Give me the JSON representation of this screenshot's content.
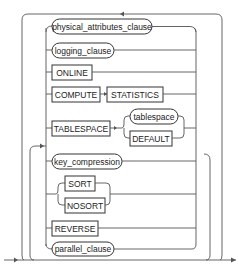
{
  "diagram": {
    "type": "railroad-syntax-diagram",
    "items": {
      "physical_attributes_clause": "physical_attributes_clause",
      "logging_clause": "logging_clause",
      "online": "ONLINE",
      "compute": "COMPUTE",
      "statistics": "STATISTICS",
      "tablespace_kw": "TABLESPACE",
      "tablespace_name": "tablespace",
      "default": "DEFAULT",
      "key_compression": "key_compression",
      "sort": "SORT",
      "nosort": "NOSORT",
      "reverse": "REVERSE",
      "parallel_clause": "parallel_clause"
    },
    "colors": {
      "line": "#555555",
      "box_border": "#333333",
      "background": "#ffffff"
    }
  }
}
